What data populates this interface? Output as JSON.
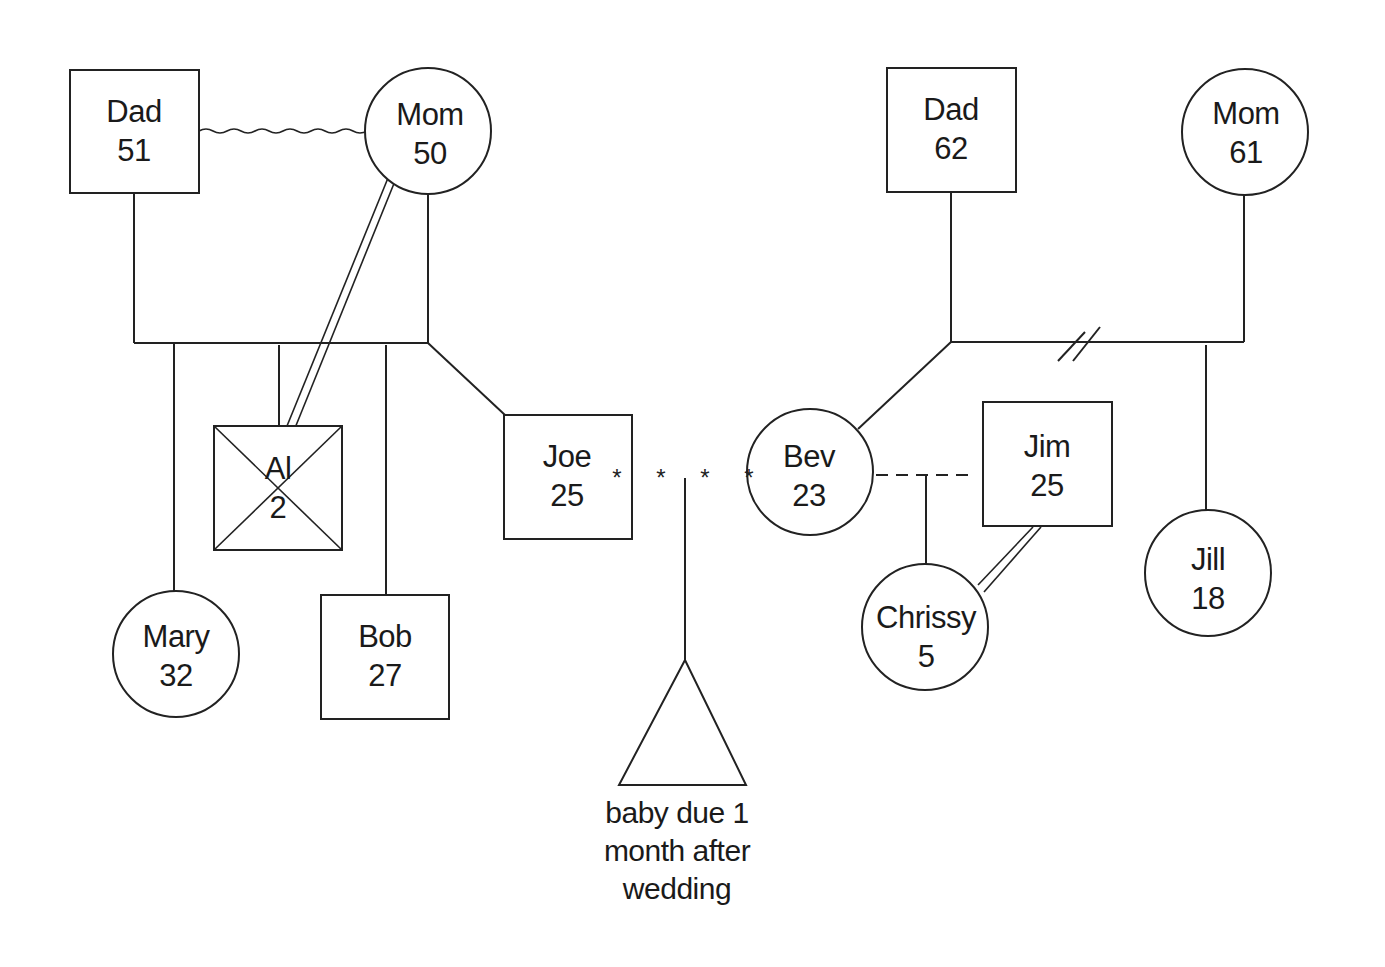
{
  "diagram": {
    "type": "genogram",
    "people": [
      {
        "id": "dad1",
        "name": "Dad",
        "age": "51",
        "sex": "male",
        "x": 134,
        "y": 131
      },
      {
        "id": "mom1",
        "name": "Mom",
        "age": "50",
        "sex": "female",
        "x": 428,
        "y": 133
      },
      {
        "id": "mary",
        "name": "Mary",
        "age": "32",
        "sex": "female",
        "x": 176,
        "y": 654
      },
      {
        "id": "al",
        "name": "Al",
        "age": "2",
        "sex": "male",
        "deceased": true,
        "x": 278,
        "y": 488
      },
      {
        "id": "bob",
        "name": "Bob",
        "age": "27",
        "sex": "male",
        "x": 385,
        "y": 656
      },
      {
        "id": "joe",
        "name": "Joe",
        "age": "25",
        "sex": "male",
        "x": 567,
        "y": 476
      },
      {
        "id": "dad2",
        "name": "Dad",
        "age": "62",
        "sex": "male",
        "x": 951,
        "y": 130
      },
      {
        "id": "mom2",
        "name": "Mom",
        "age": "61",
        "sex": "female",
        "x": 1245,
        "y": 133
      },
      {
        "id": "bev",
        "name": "Bev",
        "age": "23",
        "sex": "female",
        "x": 810,
        "y": 472
      },
      {
        "id": "jim",
        "name": "Jim",
        "age": "25",
        "sex": "male",
        "x": 1046,
        "y": 464
      },
      {
        "id": "chrissy",
        "name": "Chrissy",
        "age": "5",
        "sex": "female",
        "x": 925,
        "y": 627
      },
      {
        "id": "jill",
        "name": "Jill",
        "age": "18",
        "sex": "female",
        "x": 1208,
        "y": 578
      }
    ],
    "relationships": [
      {
        "from": "dad1",
        "to": "mom1",
        "type": "conflicted marriage (wavy line)"
      },
      {
        "from": "mom1",
        "to": "al",
        "type": "close relationship (double line)"
      },
      {
        "from": "dad2",
        "to": "mom2",
        "type": "divorced (double slash)"
      },
      {
        "from": "joe",
        "to": "bev",
        "type": "engaged / dating (asterisks)"
      },
      {
        "from": "bev",
        "to": "jim",
        "type": "unmarried partners (dashed)"
      },
      {
        "from": "jim",
        "to": "chrissy",
        "type": "close relationship (double line)"
      }
    ],
    "pregnancy": {
      "symbol": "triangle",
      "note_lines": [
        "baby due 1",
        "month after",
        "wedding"
      ]
    },
    "colors": {
      "stroke": "#222222",
      "background": "#ffffff"
    }
  }
}
